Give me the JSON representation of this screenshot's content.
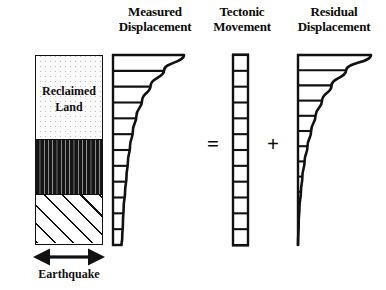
{
  "figure": {
    "width": 386,
    "height": 290,
    "background_color": "#ffffff",
    "ink_color": "#111111",
    "equation_reading": "Measured Displacement = Tectonic Movement + Residual Displacement"
  },
  "headings": {
    "measured": {
      "line1": "Measured",
      "line2": "Displacement"
    },
    "tectonic": {
      "line1": "Tectonic",
      "line2": "Movement"
    },
    "residual": {
      "line1": "Residual",
      "line2": "Displacement"
    }
  },
  "operators": {
    "equals": "=",
    "plus": "+"
  },
  "soil_column": {
    "layers": [
      {
        "name": "reclaimed-land",
        "pattern": "stipple",
        "label_line1": "Reclaimed",
        "label_line2": "Land"
      },
      {
        "name": "sand",
        "pattern": "dashed-dots",
        "label_line1": "",
        "label_line2": ""
      },
      {
        "name": "bedrock",
        "pattern": "diagonal-hatch",
        "label_line1": "",
        "label_line2": ""
      }
    ]
  },
  "earthquake": {
    "label": "Earthquake",
    "icon": "double-headed-horizontal-arrow-icon"
  },
  "chart_data": {
    "type": "line",
    "xlabel": "Horizontal displacement",
    "ylabel": "Depth",
    "orientation": "depth-on-y-inverted",
    "grid": false,
    "legend": "none",
    "series": [
      {
        "name": "Measured Displacement",
        "depth": [
          0.0,
          0.08,
          0.16,
          0.24,
          0.32,
          0.4,
          0.48,
          0.56,
          0.64,
          0.72,
          0.8,
          0.88,
          0.96,
          1.0
        ],
        "displacement": [
          1.0,
          0.72,
          0.53,
          0.41,
          0.33,
          0.28,
          0.24,
          0.21,
          0.19,
          0.17,
          0.15,
          0.14,
          0.13,
          0.12
        ],
        "rung_count": 13,
        "shape": "concave curve, wide at ground surface, tapering to a finite width at base"
      },
      {
        "name": "Tectonic Movement",
        "depth": [
          0.0,
          0.09,
          0.18,
          0.27,
          0.36,
          0.45,
          0.55,
          0.64,
          0.73,
          0.82,
          0.91,
          1.0
        ],
        "displacement": [
          0.12,
          0.12,
          0.12,
          0.12,
          0.12,
          0.12,
          0.12,
          0.12,
          0.12,
          0.12,
          0.12,
          0.12
        ],
        "rung_count": 12,
        "shape": "uniform constant-width column, same displacement at every depth"
      },
      {
        "name": "Residual Displacement",
        "depth": [
          0.0,
          0.08,
          0.16,
          0.24,
          0.32,
          0.4,
          0.48,
          0.56,
          0.64,
          0.72,
          0.8,
          0.88,
          1.0
        ],
        "displacement": [
          1.0,
          0.66,
          0.46,
          0.33,
          0.24,
          0.18,
          0.13,
          0.09,
          0.06,
          0.04,
          0.02,
          0.01,
          0.0
        ],
        "rung_count": 11,
        "shape": "concave curve, wide at ground surface, tapering to zero at base"
      }
    ]
  }
}
